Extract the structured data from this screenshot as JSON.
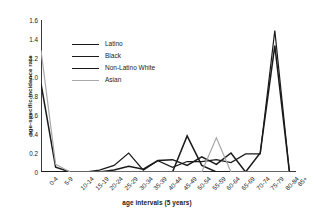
{
  "chart_data": {
    "type": "line",
    "title": "",
    "xlabel": "age intervals (5 years)",
    "ylabel": "age-specific incidence rate",
    "categories": [
      "0-4",
      "5-9",
      "10-14",
      "15-19",
      "20-24",
      "25-29",
      "30-34",
      "35-39",
      "40-44",
      "45-49",
      "50-54",
      "55-59",
      "60-64",
      "65-69",
      "70-74",
      "75-79",
      "80-84",
      "85+"
    ],
    "ylim": [
      0,
      1.6
    ],
    "yticks": [
      "0",
      "0.2",
      "0.4",
      "0.6",
      "0.8",
      "1.0",
      "1.2",
      "1.4",
      "1.6"
    ],
    "ytick_values": [
      0,
      0.2,
      0.4,
      0.6,
      0.8,
      1.0,
      1.2,
      1.4,
      1.6
    ],
    "grid": false,
    "legend_position": "upper-left-inside",
    "series": [
      {
        "name": "Latino",
        "color": "#1a1a1a",
        "width": 1.5,
        "values": [
          0.93,
          0.05,
          0.0,
          0.0,
          0.0,
          0.02,
          0.06,
          0.03,
          0.12,
          0.13,
          0.07,
          0.16,
          0.08,
          0.2,
          0.0,
          0.2,
          1.33,
          0.0
        ]
      },
      {
        "name": "Black",
        "color": "#1a1a1a",
        "width": 1.5,
        "values": [
          0.0,
          0.0,
          0.0,
          0.0,
          0.0,
          0.0,
          0.0,
          0.0,
          0.0,
          0.0,
          0.38,
          0.07,
          0.0,
          0.0,
          0.0,
          0.0,
          0.0,
          0.0
        ]
      },
      {
        "name": "Non-Latino White",
        "color": "#1a1a1a",
        "width": 1.2,
        "values": [
          0.0,
          0.0,
          0.0,
          0.0,
          0.02,
          0.07,
          0.2,
          0.02,
          0.12,
          0.05,
          0.11,
          0.11,
          0.13,
          0.1,
          0.19,
          0.19,
          1.49,
          0.0
        ]
      },
      {
        "name": "Asian",
        "color": "#a8a8a8",
        "width": 1.2,
        "values": [
          1.28,
          0.08,
          0.0,
          0.0,
          0.0,
          0.0,
          0.0,
          0.0,
          0.0,
          0.0,
          0.0,
          0.0,
          0.36,
          0.0,
          0.0,
          0.0,
          0.0,
          0.0
        ]
      }
    ]
  },
  "legend": {
    "items": [
      {
        "label": "Latino"
      },
      {
        "label": "Black"
      },
      {
        "label": "Non-Latino White"
      },
      {
        "label": "Asian"
      }
    ]
  }
}
